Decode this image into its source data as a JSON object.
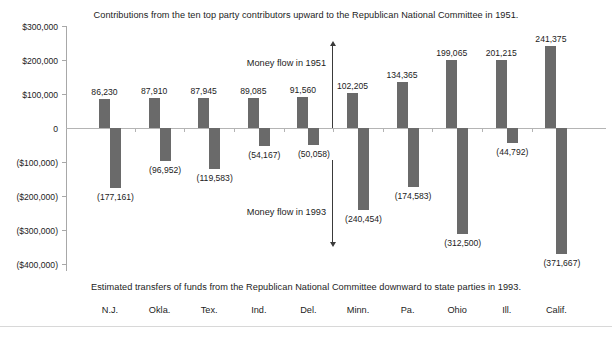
{
  "chart_data": {
    "type": "bar",
    "title": "Contributions from the ten top party contributors upward to the Republican National Committee in 1951.",
    "caption": "Estimated transfers of funds from the Republican National Committee downward to state parties in 1993.",
    "xlabel": "",
    "ylabel": "",
    "ylim": [
      -400000,
      300000
    ],
    "grid": false,
    "legend": "none",
    "categories": [
      "N.J.",
      "Okla.",
      "Tex.",
      "Ind.",
      "Del.",
      "Minn.",
      "Pa.",
      "Ohio",
      "Ill.",
      "Calif."
    ],
    "series": [
      {
        "name": "Money flow in 1951",
        "values": [
          86230,
          87910,
          87945,
          89085,
          91560,
          102205,
          134365,
          199065,
          201215,
          241375
        ],
        "labels": [
          "86,230",
          "87,910",
          "87,945",
          "89,085",
          "91,560",
          "102,205",
          "134,365",
          "199,065",
          "201,215",
          "241,375"
        ]
      },
      {
        "name": "Money flow in 1993",
        "values": [
          -177161,
          -96952,
          -119583,
          -54167,
          -50058,
          -240454,
          -174583,
          -312500,
          -44792,
          -371667
        ],
        "labels": [
          "(177,161)",
          "(96,952)",
          "(119,583)",
          "(54,167)",
          "(50,058)",
          "(240,454)",
          "(174,583)",
          "(312,500)",
          "(44,792)",
          "(371,667)"
        ]
      }
    ],
    "y_ticks": [
      {
        "value": 300000,
        "label": "$300,000"
      },
      {
        "value": 200000,
        "label": "$200,000"
      },
      {
        "value": 100000,
        "label": "$100,000"
      },
      {
        "value": 0,
        "label": "0"
      },
      {
        "value": -100000,
        "label": "($100,000)"
      },
      {
        "value": -200000,
        "label": "($200,000)"
      },
      {
        "value": -300000,
        "label": "($300,000)"
      },
      {
        "value": -400000,
        "label": "($400,000)"
      }
    ],
    "annotations": [
      {
        "text": "Money flow in 1951",
        "direction": "up"
      },
      {
        "text": "Money flow in 1993",
        "direction": "down"
      }
    ],
    "colors": {
      "bar": "#6a6a6a",
      "axis": "#a8a8a8",
      "text": "#1c1c1c",
      "background": "#ffffff"
    }
  }
}
